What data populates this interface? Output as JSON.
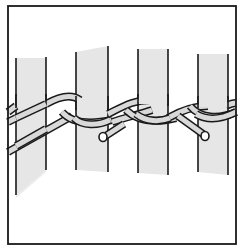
{
  "figure": {
    "description": "Line illustration of twining weave: two weavers crossing between upright stakes",
    "width": 244,
    "height": 252,
    "colors": {
      "background": "#ffffff",
      "stroke": "#1a1a1a",
      "stake_fill": "#e6e6e6",
      "weaver_fill": "#d9d9d9",
      "shadow_fill": "#ececec"
    },
    "frame": {
      "x": 8,
      "y": 6,
      "width": 228,
      "height": 238
    },
    "stakes": [
      {
        "name": "stake-1",
        "left": 16,
        "right": 46,
        "top_left": 58,
        "top_right": 58,
        "bottom_left": 195,
        "bottom_right": 170
      },
      {
        "name": "stake-2",
        "left": 76,
        "right": 108,
        "top_left": 52,
        "top_right": 46,
        "bottom_left": 170,
        "bottom_right": 172
      },
      {
        "name": "stake-3",
        "left": 138,
        "right": 168,
        "top_left": 49,
        "top_right": 49,
        "bottom_left": 173,
        "bottom_right": 175
      },
      {
        "name": "stake-4",
        "left": 198,
        "right": 228,
        "top_left": 54,
        "top_right": 54,
        "bottom_left": 172,
        "bottom_right": 175
      }
    ],
    "weaver_ends": [
      {
        "name": "weaver-end-1",
        "cx": 103,
        "cy": 137
      },
      {
        "name": "weaver-end-2",
        "cx": 205,
        "cy": 136
      }
    ]
  }
}
